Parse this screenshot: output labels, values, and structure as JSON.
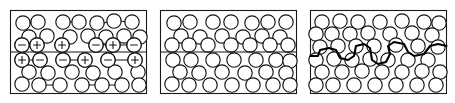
{
  "figure": {
    "width": 455,
    "height": 103,
    "background_color": "#ffffff",
    "line_color": "#141414",
    "atom_fill_color": "#ffffff",
    "panel_count": 3
  },
  "panels": [
    {
      "id": "panel-a",
      "name": "charged-grain-boundary",
      "frame": {
        "x": 10.5,
        "y": 10.5,
        "width": 136,
        "height": 83
      },
      "boundary": {
        "type": "straight",
        "y": 52.0,
        "x_start": 10.5,
        "x_end": 146.5,
        "has_charges": true
      },
      "charge_signs_upper": [
        "-",
        "+",
        "+",
        "-",
        "+",
        "-"
      ],
      "charge_signs_lower": [
        "+",
        "-",
        "-",
        "+",
        "-",
        "+"
      ],
      "atoms": [
        {
          "cx": 23,
          "cy": 23,
          "r": 7.2
        },
        {
          "cx": 38,
          "cy": 22,
          "r": 7.2
        },
        {
          "cx": 63,
          "cy": 22,
          "r": 7.2
        },
        {
          "cx": 79,
          "cy": 22,
          "r": 7.2
        },
        {
          "cx": 97,
          "cy": 23,
          "r": 7.2
        },
        {
          "cx": 114,
          "cy": 21,
          "r": 7.2
        },
        {
          "cx": 132,
          "cy": 22,
          "r": 7.2
        },
        {
          "cx": 29,
          "cy": 37,
          "r": 7.2
        },
        {
          "cx": 47,
          "cy": 36,
          "r": 7.2
        },
        {
          "cx": 70,
          "cy": 37,
          "r": 7.2
        },
        {
          "cx": 88,
          "cy": 36,
          "r": 7.2
        },
        {
          "cx": 106,
          "cy": 37,
          "r": 7.2
        },
        {
          "cx": 124,
          "cy": 36,
          "r": 7.2
        },
        {
          "cx": 140,
          "cy": 37,
          "r": 7.2
        },
        {
          "cx": 22,
          "cy": 45,
          "r": 7.2
        },
        {
          "cx": 37,
          "cy": 45,
          "r": 7.2
        },
        {
          "cx": 62,
          "cy": 45,
          "r": 7.2
        },
        {
          "cx": 96,
          "cy": 45,
          "r": 7.2
        },
        {
          "cx": 113,
          "cy": 45,
          "r": 7.2
        },
        {
          "cx": 134,
          "cy": 45,
          "r": 7.2
        },
        {
          "cx": 22,
          "cy": 60,
          "r": 7.2
        },
        {
          "cx": 40,
          "cy": 60,
          "r": 7.2
        },
        {
          "cx": 63,
          "cy": 60,
          "r": 7.2
        },
        {
          "cx": 85,
          "cy": 60,
          "r": 7.2
        },
        {
          "cx": 108,
          "cy": 60,
          "r": 7.2
        },
        {
          "cx": 135,
          "cy": 60,
          "r": 7.2
        },
        {
          "cx": 29,
          "cy": 72,
          "r": 7.2
        },
        {
          "cx": 48,
          "cy": 73,
          "r": 7.2
        },
        {
          "cx": 72,
          "cy": 72,
          "r": 7.2
        },
        {
          "cx": 93,
          "cy": 73,
          "r": 7.2
        },
        {
          "cx": 115,
          "cy": 72,
          "r": 7.2
        },
        {
          "cx": 138,
          "cy": 72,
          "r": 7.2
        },
        {
          "cx": 22,
          "cy": 84,
          "r": 7.2
        },
        {
          "cx": 39,
          "cy": 85,
          "r": 7.2
        },
        {
          "cx": 60,
          "cy": 85,
          "r": 7.2
        },
        {
          "cx": 82,
          "cy": 85,
          "r": 7.2
        },
        {
          "cx": 102,
          "cy": 85,
          "r": 7.2
        },
        {
          "cx": 122,
          "cy": 85,
          "r": 7.2
        },
        {
          "cx": 139,
          "cy": 85,
          "r": 7.2
        }
      ]
    },
    {
      "id": "panel-b",
      "name": "neutral-straight-grain-boundary",
      "frame": {
        "x": 160.5,
        "y": 10.5,
        "width": 136,
        "height": 83
      },
      "boundary": {
        "type": "straight",
        "y": 52.0,
        "x_start": 160.5,
        "x_end": 296.5,
        "has_charges": false
      },
      "charge_signs_upper": [],
      "charge_signs_lower": [],
      "atoms": [
        {
          "cx": 174,
          "cy": 23,
          "r": 7.2
        },
        {
          "cx": 190,
          "cy": 22,
          "r": 7.2
        },
        {
          "cx": 213,
          "cy": 22,
          "r": 7.2
        },
        {
          "cx": 231,
          "cy": 22,
          "r": 7.2
        },
        {
          "cx": 252,
          "cy": 23,
          "r": 7.2
        },
        {
          "cx": 268,
          "cy": 22,
          "r": 7.2
        },
        {
          "cx": 286,
          "cy": 22,
          "r": 7.2
        },
        {
          "cx": 181,
          "cy": 36,
          "r": 7.2
        },
        {
          "cx": 200,
          "cy": 37,
          "r": 7.2
        },
        {
          "cx": 222,
          "cy": 36,
          "r": 7.2
        },
        {
          "cx": 243,
          "cy": 37,
          "r": 7.2
        },
        {
          "cx": 262,
          "cy": 36,
          "r": 7.2
        },
        {
          "cx": 280,
          "cy": 37,
          "r": 7.2
        },
        {
          "cx": 172,
          "cy": 45,
          "r": 7.2
        },
        {
          "cx": 189,
          "cy": 45,
          "r": 7.2
        },
        {
          "cx": 208,
          "cy": 45,
          "r": 7.2
        },
        {
          "cx": 231,
          "cy": 45,
          "r": 7.2
        },
        {
          "cx": 250,
          "cy": 45,
          "r": 7.2
        },
        {
          "cx": 270,
          "cy": 45,
          "r": 7.2
        },
        {
          "cx": 288,
          "cy": 45,
          "r": 7.2
        },
        {
          "cx": 173,
          "cy": 60,
          "r": 7.2
        },
        {
          "cx": 191,
          "cy": 60,
          "r": 7.2
        },
        {
          "cx": 213,
          "cy": 60,
          "r": 7.2
        },
        {
          "cx": 234,
          "cy": 60,
          "r": 7.2
        },
        {
          "cx": 256,
          "cy": 60,
          "r": 7.2
        },
        {
          "cx": 276,
          "cy": 60,
          "r": 7.2
        },
        {
          "cx": 290,
          "cy": 61,
          "r": 7.2
        },
        {
          "cx": 180,
          "cy": 72,
          "r": 7.2
        },
        {
          "cx": 199,
          "cy": 73,
          "r": 7.2
        },
        {
          "cx": 222,
          "cy": 72,
          "r": 7.2
        },
        {
          "cx": 245,
          "cy": 73,
          "r": 7.2
        },
        {
          "cx": 266,
          "cy": 72,
          "r": 7.2
        },
        {
          "cx": 286,
          "cy": 73,
          "r": 7.2
        },
        {
          "cx": 172,
          "cy": 84,
          "r": 7.2
        },
        {
          "cx": 189,
          "cy": 85,
          "r": 7.2
        },
        {
          "cx": 210,
          "cy": 85,
          "r": 7.2
        },
        {
          "cx": 232,
          "cy": 85,
          "r": 7.2
        },
        {
          "cx": 253,
          "cy": 85,
          "r": 7.2
        },
        {
          "cx": 273,
          "cy": 85,
          "r": 7.2
        },
        {
          "cx": 290,
          "cy": 85,
          "r": 7.2
        }
      ]
    },
    {
      "id": "panel-c",
      "name": "meandering-grain-boundary",
      "frame": {
        "x": 310.5,
        "y": 10.5,
        "width": 136,
        "height": 83
      },
      "boundary": {
        "type": "meandering",
        "path": "M 310.5 56 L 318 56 L 320 50 L 329 48 L 336 50 L 340 58 L 348 60 L 354 56 L 356 46 L 364 44 L 370 48 L 372 60 L 378 64 L 386 62 L 390 54 L 388 46 L 394 42 L 404 44 L 408 52 L 414 56 L 424 54 L 430 46 L 438 44 L 446.5 46",
        "has_charges": false
      },
      "charge_signs_upper": [],
      "charge_signs_lower": [],
      "atoms": [
        {
          "cx": 322,
          "cy": 22,
          "r": 7.2
        },
        {
          "cx": 340,
          "cy": 21,
          "r": 7.2
        },
        {
          "cx": 358,
          "cy": 22,
          "r": 7.2
        },
        {
          "cx": 380,
          "cy": 22,
          "r": 7.2
        },
        {
          "cx": 402,
          "cy": 21,
          "r": 7.2
        },
        {
          "cx": 424,
          "cy": 22,
          "r": 7.2
        },
        {
          "cx": 439,
          "cy": 23,
          "r": 7.2
        },
        {
          "cx": 316,
          "cy": 34,
          "r": 7.2
        },
        {
          "cx": 332,
          "cy": 34,
          "r": 7.2
        },
        {
          "cx": 350,
          "cy": 34,
          "r": 7.2
        },
        {
          "cx": 368,
          "cy": 33,
          "r": 7.2
        },
        {
          "cx": 390,
          "cy": 34,
          "r": 7.2
        },
        {
          "cx": 412,
          "cy": 33,
          "r": 7.2
        },
        {
          "cx": 432,
          "cy": 35,
          "r": 7.2
        },
        {
          "cx": 320,
          "cy": 47,
          "r": 7.2
        },
        {
          "cx": 338,
          "cy": 46,
          "r": 7.2
        },
        {
          "cx": 356,
          "cy": 46,
          "r": 7.2
        },
        {
          "cx": 374,
          "cy": 46,
          "r": 7.2
        },
        {
          "cx": 396,
          "cy": 45,
          "r": 7.2
        },
        {
          "cx": 418,
          "cy": 46,
          "r": 7.2
        },
        {
          "cx": 438,
          "cy": 47,
          "r": 7.2
        },
        {
          "cx": 316,
          "cy": 60,
          "r": 7.2
        },
        {
          "cx": 334,
          "cy": 59,
          "r": 7.2
        },
        {
          "cx": 352,
          "cy": 60,
          "r": 7.2
        },
        {
          "cx": 370,
          "cy": 59,
          "r": 7.2
        },
        {
          "cx": 388,
          "cy": 60,
          "r": 7.2
        },
        {
          "cx": 408,
          "cy": 60,
          "r": 7.2
        },
        {
          "cx": 428,
          "cy": 60,
          "r": 7.2
        },
        {
          "cx": 322,
          "cy": 72,
          "r": 7.2
        },
        {
          "cx": 342,
          "cy": 72,
          "r": 7.2
        },
        {
          "cx": 362,
          "cy": 71,
          "r": 7.2
        },
        {
          "cx": 382,
          "cy": 72,
          "r": 7.2
        },
        {
          "cx": 402,
          "cy": 72,
          "r": 7.2
        },
        {
          "cx": 422,
          "cy": 71,
          "r": 7.2
        },
        {
          "cx": 440,
          "cy": 72,
          "r": 7.2
        },
        {
          "cx": 316,
          "cy": 85,
          "r": 7.2
        },
        {
          "cx": 333,
          "cy": 85,
          "r": 7.2
        },
        {
          "cx": 354,
          "cy": 85,
          "r": 7.2
        },
        {
          "cx": 375,
          "cy": 85,
          "r": 7.2
        },
        {
          "cx": 396,
          "cy": 85,
          "r": 7.2
        },
        {
          "cx": 417,
          "cy": 85,
          "r": 7.2
        },
        {
          "cx": 436,
          "cy": 85,
          "r": 7.2
        }
      ]
    }
  ],
  "charge_row_geometry": {
    "upper_row_y": 45,
    "lower_row_y": 60,
    "upper_x": [
      22,
      37,
      62,
      96,
      113,
      134
    ],
    "lower_x": [
      22,
      40,
      63,
      85,
      108,
      135
    ],
    "sign_arm": 3.4
  },
  "bonds": [
    {
      "x1": 30,
      "y1": 23,
      "x2": 31,
      "y2": 22
    },
    {
      "x1": 70,
      "y1": 22,
      "x2": 72,
      "y2": 22
    },
    {
      "x1": 104,
      "y1": 23,
      "x2": 107,
      "y2": 22
    },
    {
      "x1": 121,
      "y1": 21,
      "x2": 125,
      "y2": 22
    },
    {
      "x1": 29,
      "y1": 45,
      "x2": 30,
      "y2": 45
    },
    {
      "x1": 103,
      "y1": 45,
      "x2": 106,
      "y2": 45
    },
    {
      "x1": 120,
      "y1": 45,
      "x2": 127,
      "y2": 45
    },
    {
      "x1": 29,
      "y1": 60,
      "x2": 33,
      "y2": 60
    },
    {
      "x1": 70,
      "y1": 60,
      "x2": 78,
      "y2": 60
    },
    {
      "x1": 115,
      "y1": 60,
      "x2": 128,
      "y2": 60
    },
    {
      "x1": 46,
      "y1": 85,
      "x2": 53,
      "y2": 85
    },
    {
      "x1": 89,
      "y1": 85,
      "x2": 95,
      "y2": 85
    },
    {
      "x1": 109,
      "y1": 85,
      "x2": 115,
      "y2": 85
    }
  ]
}
